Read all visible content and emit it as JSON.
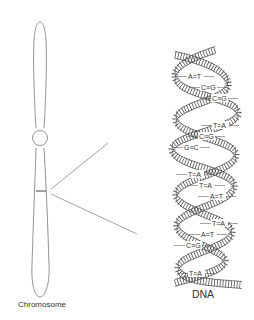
{
  "diagram": {
    "labels": {
      "chromosome": "Chromosome",
      "dna": "DNA"
    },
    "base_pairs": [
      {
        "label": "A=T",
        "x": 188,
        "y": 79
      },
      {
        "label": "C≡G",
        "x": 201,
        "y": 90
      },
      {
        "label": "C≡G",
        "x": 212,
        "y": 101
      },
      {
        "label": "T=A",
        "x": 213,
        "y": 128
      },
      {
        "label": "C≡G",
        "x": 199,
        "y": 139
      },
      {
        "label": "G≡C",
        "x": 184,
        "y": 150
      },
      {
        "label": "T=A",
        "x": 188,
        "y": 177
      },
      {
        "label": "T=A",
        "x": 199,
        "y": 188
      },
      {
        "label": "A=T",
        "x": 210,
        "y": 199
      },
      {
        "label": "T=A",
        "x": 212,
        "y": 226
      },
      {
        "label": "A=T",
        "x": 201,
        "y": 237
      },
      {
        "label": "C≡G",
        "x": 186,
        "y": 248
      },
      {
        "label": "T=A",
        "x": 189,
        "y": 276
      }
    ],
    "colors": {
      "stroke": "#555555",
      "text": "#333333",
      "background": "#ffffff"
    }
  }
}
